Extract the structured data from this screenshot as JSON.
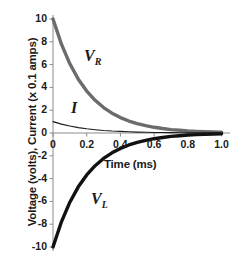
{
  "chart_data": {
    "type": "line",
    "title": "",
    "subtitle": "",
    "xlabel": "Time (ms)",
    "ylabel": "Voltage (volts), Current (x 0.1 amps)",
    "xlim": [
      0,
      1.05
    ],
    "ylim": [
      -10,
      10
    ],
    "xticks": [
      "0",
      "0.2",
      "0.4",
      "0.6",
      "0.8",
      "1.0"
    ],
    "xtick_values": [
      0,
      0.2,
      0.4,
      0.6,
      0.8,
      1.0
    ],
    "yticks": [
      "10",
      "8",
      "6",
      "4",
      "2",
      "0",
      "-2",
      "-4",
      "-6",
      "-8",
      "-10"
    ],
    "ytick_values": [
      10,
      8,
      6,
      4,
      2,
      0,
      -2,
      -4,
      -6,
      -8,
      -10
    ],
    "grid": false,
    "legend_position": "inline-annotations",
    "time_constant_ms": 0.2,
    "series": [
      {
        "name": "V_R",
        "label_main": "V",
        "label_sub": "R",
        "color": "#6b6b6b",
        "width": 3.4,
        "description": "Resistor voltage, exponential decay from 10 volts to 0",
        "x": [
          0,
          0.05,
          0.1,
          0.15,
          0.2,
          0.25,
          0.3,
          0.35,
          0.4,
          0.45,
          0.5,
          0.55,
          0.6,
          0.65,
          0.7,
          0.75,
          0.8,
          0.85,
          0.9,
          0.95,
          1.0
        ],
        "values": [
          10.0,
          7.79,
          6.07,
          4.72,
          3.68,
          2.87,
          2.23,
          1.74,
          1.35,
          1.05,
          0.82,
          0.64,
          0.5,
          0.39,
          0.3,
          0.24,
          0.18,
          0.14,
          0.11,
          0.09,
          0.07
        ]
      },
      {
        "name": "I",
        "label_main": "I",
        "label_sub": "",
        "color": "#1a1a1a",
        "width": 1.1,
        "description": "Current, exponential decay from 1 (x 0.1 amps) to 0",
        "x": [
          0,
          0.05,
          0.1,
          0.15,
          0.2,
          0.25,
          0.3,
          0.35,
          0.4,
          0.45,
          0.5,
          0.55,
          0.6,
          0.65,
          0.7,
          0.75,
          0.8,
          0.85,
          0.9,
          0.95,
          1.0
        ],
        "values": [
          1.0,
          0.78,
          0.61,
          0.47,
          0.37,
          0.29,
          0.22,
          0.17,
          0.14,
          0.11,
          0.08,
          0.06,
          0.05,
          0.04,
          0.03,
          0.02,
          0.02,
          0.01,
          0.01,
          0.01,
          0.01
        ]
      },
      {
        "name": "V_L",
        "label_main": "V",
        "label_sub": "L",
        "color": "#111111",
        "width": 3.4,
        "description": "Inductor voltage, exponential rise from -10 volts to 0",
        "x": [
          0,
          0.05,
          0.1,
          0.15,
          0.2,
          0.25,
          0.3,
          0.35,
          0.4,
          0.45,
          0.5,
          0.55,
          0.6,
          0.65,
          0.7,
          0.75,
          0.8,
          0.85,
          0.9,
          0.95,
          1.0
        ],
        "values": [
          -10.0,
          -7.79,
          -6.07,
          -4.72,
          -3.68,
          -2.87,
          -2.23,
          -1.74,
          -1.35,
          -1.05,
          -0.82,
          -0.64,
          -0.5,
          -0.39,
          -0.3,
          -0.24,
          -0.18,
          -0.14,
          -0.11,
          -0.09,
          -0.07
        ]
      }
    ]
  },
  "colors": {
    "axis": "#8c8c8c",
    "vr_curve": "#6b6b6b",
    "i_curve": "#1a1a1a",
    "vl_curve": "#111111",
    "text": "#1a1a1a",
    "background": "#ffffff"
  }
}
